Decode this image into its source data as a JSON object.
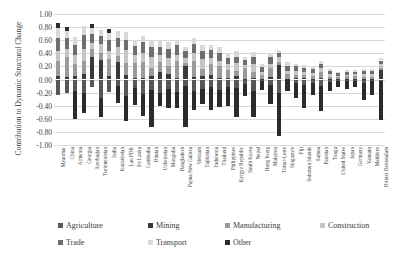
{
  "chart_data": {
    "type": "bar",
    "stacked": true,
    "title": "",
    "xlabel": "",
    "ylabel": "Contribution to Dynamic Structural Change",
    "ylim": [
      -1.0,
      1.0
    ],
    "yticks": [
      "1.00",
      "0.80",
      "0.60",
      "0.40",
      "0.20",
      "0.00",
      "-0.20",
      "-0.40",
      "-0.60",
      "-0.80",
      "-1.00"
    ],
    "ytick_values": [
      1.0,
      0.8,
      0.6,
      0.4,
      0.2,
      0.0,
      -0.2,
      -0.4,
      -0.6,
      -0.8,
      -1.0
    ],
    "grid": true,
    "legend_position": "bottom",
    "categories": [
      "Myanmar",
      "China",
      "Armenia",
      "Georgia",
      "Azerbaijan",
      "Turkmenistan",
      "India",
      "Kazakhstan",
      "Lao PDR",
      "Sri Lanka",
      "Cambodia",
      "Bhutan",
      "Uzbekistan",
      "Mongolia",
      "Bangladesh",
      "Papua New Guinea",
      "Vietnam",
      "Tajikistan",
      "Indonesia",
      "Thailand",
      "Philippines",
      "Kyrgyz Republic",
      "South Korea",
      "Nepal",
      "Hong Kong",
      "Malaysia",
      "Timor-Leste",
      "Singapore",
      "Fiji",
      "Solomon Islands",
      "Samoa",
      "Pakistan",
      "Tonga",
      "United States",
      "Japan",
      "Germany",
      "Vanuatu",
      "Maldives",
      "Brunei Darussalam"
    ],
    "series": [
      {
        "name": "Agriculture",
        "color": "#585858",
        "values": [
          -0.24,
          -0.2,
          -0.18,
          -0.21,
          -0.12,
          -0.28,
          -0.19,
          -0.1,
          -0.25,
          -0.13,
          -0.22,
          -0.16,
          -0.2,
          -0.15,
          -0.19,
          -0.1,
          -0.17,
          -0.14,
          -0.12,
          -0.16,
          -0.11,
          -0.13,
          -0.07,
          -0.18,
          -0.02,
          -0.08,
          -0.2,
          -0.01,
          -0.06,
          -0.09,
          -0.05,
          -0.1,
          -0.04,
          -0.02,
          -0.02,
          -0.02,
          -0.05,
          -0.03,
          -0.02
        ]
      },
      {
        "name": "Mining",
        "color": "#3a3a3a",
        "values": [
          0.06,
          0.04,
          0.05,
          0.08,
          0.34,
          0.3,
          0.05,
          0.26,
          0.07,
          0.03,
          0.03,
          0.05,
          0.12,
          0.09,
          0.02,
          0.2,
          0.04,
          0.06,
          0.07,
          0.03,
          0.02,
          0.05,
          0.01,
          0.02,
          0.01,
          0.04,
          0.22,
          0.01,
          0.02,
          0.03,
          0.01,
          0.02,
          0.01,
          0.01,
          0.01,
          0.01,
          0.01,
          0.01,
          0.14
        ]
      },
      {
        "name": "Manufacturing",
        "color": "#9a9a9a",
        "values": [
          0.22,
          0.3,
          0.18,
          0.2,
          0.12,
          0.1,
          0.26,
          0.1,
          0.18,
          0.22,
          0.24,
          0.12,
          0.14,
          0.12,
          0.26,
          0.05,
          0.24,
          0.1,
          0.16,
          0.18,
          0.12,
          0.08,
          0.16,
          0.1,
          0.06,
          0.14,
          0.04,
          0.08,
          0.05,
          0.04,
          0.04,
          0.09,
          0.03,
          0.03,
          0.04,
          0.05,
          0.03,
          0.03,
          0.04
        ]
      },
      {
        "name": "Construction",
        "color": "#c6c6c6",
        "values": [
          0.16,
          0.12,
          0.14,
          0.18,
          0.1,
          0.14,
          0.12,
          0.14,
          0.2,
          0.12,
          0.14,
          0.18,
          0.12,
          0.12,
          0.1,
          0.08,
          0.12,
          0.16,
          0.1,
          0.08,
          0.09,
          0.12,
          0.05,
          0.12,
          0.04,
          0.06,
          0.08,
          0.04,
          0.06,
          0.05,
          0.05,
          0.06,
          0.04,
          0.02,
          0.02,
          0.02,
          0.04,
          0.04,
          0.05
        ]
      },
      {
        "name": "Trade",
        "color": "#6e6e6e",
        "values": [
          0.2,
          0.18,
          0.16,
          0.22,
          0.14,
          0.12,
          0.18,
          0.14,
          0.16,
          0.14,
          0.16,
          0.14,
          0.12,
          0.14,
          0.14,
          0.1,
          0.14,
          0.12,
          0.12,
          0.12,
          0.1,
          0.1,
          0.08,
          0.1,
          0.08,
          0.1,
          0.06,
          0.08,
          0.07,
          0.06,
          0.06,
          0.07,
          0.05,
          0.04,
          0.04,
          0.04,
          0.05,
          0.05,
          0.06
        ]
      },
      {
        "name": "Transport",
        "color": "#d9d9d9",
        "values": [
          0.14,
          0.1,
          0.12,
          0.14,
          0.08,
          0.1,
          0.1,
          0.1,
          0.12,
          0.1,
          0.1,
          0.12,
          0.1,
          0.1,
          0.08,
          0.06,
          0.1,
          0.08,
          0.08,
          0.08,
          0.07,
          0.08,
          0.05,
          0.08,
          0.05,
          0.06,
          0.05,
          0.05,
          0.04,
          0.04,
          0.04,
          0.05,
          0.03,
          0.02,
          0.03,
          0.03,
          0.03,
          0.03,
          0.04
        ]
      },
      {
        "name": "Other",
        "color": "#2b2b2b",
        "values": [
          0.08,
          0.06,
          -0.42,
          -0.3,
          0.06,
          -0.3,
          0.06,
          -0.26,
          -0.38,
          -0.26,
          -0.34,
          -0.56,
          -0.2,
          -0.28,
          -0.24,
          -0.62,
          -0.3,
          -0.24,
          -0.34,
          -0.26,
          -0.3,
          -0.44,
          -0.18,
          -0.4,
          -0.14,
          -0.3,
          -0.66,
          -0.16,
          -0.22,
          -0.34,
          -0.18,
          -0.38,
          -0.14,
          -0.1,
          -0.12,
          -0.1,
          -0.26,
          -0.2,
          -0.6
        ]
      }
    ]
  },
  "legend": {
    "row1": [
      {
        "label": "Agriculture",
        "color": "#585858"
      },
      {
        "label": "Mining",
        "color": "#3a3a3a"
      },
      {
        "label": "Manufacturing",
        "color": "#9a9a9a"
      },
      {
        "label": "Construction",
        "color": "#c6c6c6"
      }
    ],
    "row2": [
      {
        "label": "Trade",
        "color": "#6e6e6e"
      },
      {
        "label": "Transport",
        "color": "#d9d9d9"
      },
      {
        "label": "Other",
        "color": "#2b2b2b"
      }
    ]
  }
}
